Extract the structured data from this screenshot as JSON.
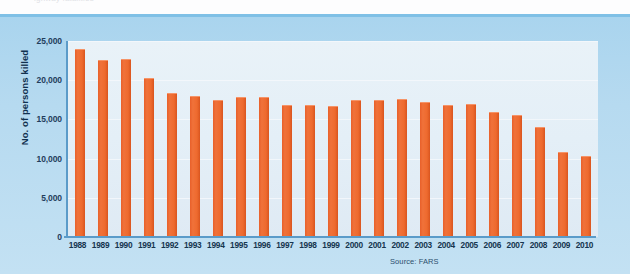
{
  "figure": {
    "ghost_text": "ighway fatalities",
    "source_note": "Source: FARS",
    "colors": {
      "bar": "#ee6a2e",
      "panel_background": "#b6daf0",
      "plot_background": "#e4eff7",
      "axis": "#5b9bc9",
      "text": "#15354f"
    }
  },
  "chart_data": {
    "type": "bar",
    "title": "",
    "xlabel": "",
    "ylabel": "No. of persons killed",
    "ylim": [
      0,
      25000
    ],
    "yticks": [
      0,
      5000,
      10000,
      15000,
      20000,
      25000
    ],
    "ytick_labels": [
      "0",
      "5,000",
      "10,000",
      "15,000",
      "20,000",
      "25,000"
    ],
    "grid": true,
    "legend": null,
    "source": "FARS",
    "categories": [
      "1988",
      "1989",
      "1990",
      "1991",
      "1992",
      "1993",
      "1994",
      "1995",
      "1996",
      "1997",
      "1998",
      "1999",
      "2000",
      "2001",
      "2002",
      "2003",
      "2004",
      "2005",
      "2006",
      "2007",
      "2008",
      "2009",
      "2010"
    ],
    "values": [
      23833,
      22424,
      22587,
      20159,
      18290,
      17908,
      17308,
      17732,
      17749,
      16711,
      16673,
      16572,
      17380,
      17400,
      17524,
      17105,
      16694,
      16885,
      15829,
      15387,
      13846,
      10759,
      10228
    ]
  }
}
